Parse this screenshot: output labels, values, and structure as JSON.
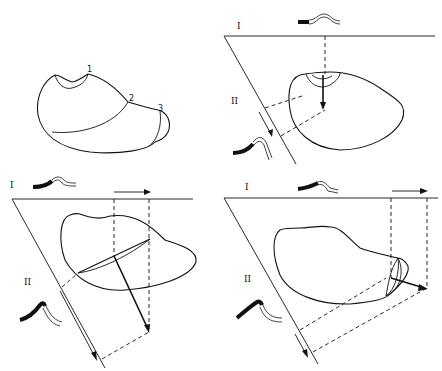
{
  "figure": {
    "panels": [
      {
        "id": "panel-top-left",
        "description": "Outline with three numbered boundaries",
        "labels": [
          "1",
          "2",
          "3"
        ]
      },
      {
        "id": "panel-top-right",
        "plane_labels": {
          "upper": "I",
          "lower": "II"
        }
      },
      {
        "id": "panel-bottom-left",
        "plane_labels": {
          "upper": "I",
          "lower": "II"
        }
      },
      {
        "id": "panel-bottom-right",
        "plane_labels": {
          "upper": "I",
          "lower": "II"
        }
      }
    ]
  },
  "colors": {
    "ink": "#111111",
    "background": "#ffffff"
  }
}
